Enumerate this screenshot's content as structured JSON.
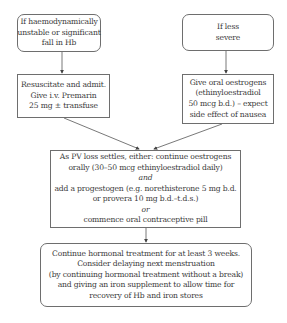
{
  "flowchart": {
    "nodes": {
      "unstable": {
        "shape": "rounded",
        "lines": [
          "If haemodynamically",
          "unstable or significant",
          "fall in Hb"
        ]
      },
      "less_severe": {
        "shape": "rounded",
        "lines": [
          "If less",
          "severe"
        ]
      },
      "resuscitate": {
        "shape": "rectangle",
        "lines": [
          "Resuscitate and admit.",
          "Give i.v. Premarin",
          "25 mg ± transfuse"
        ]
      },
      "oral_oestrogens": {
        "shape": "rectangle",
        "lines": [
          "Give oral oestrogens",
          "(ethinyloestradiol",
          "50 mcg b.d.) – expect",
          "side effect of nausea"
        ]
      },
      "pv_loss": {
        "shape": "rectangle",
        "lines": [
          "As PV loss settles, either: continue oestrogens",
          "orally (30–50 mcg ethinyloestradiol daily)",
          "and",
          "add a progestogen (e.g. norethisterone 5 mg b.d.",
          "or provera 10 mg b.d.–t.d.s.)",
          "or",
          "commence oral contraceptive pill"
        ],
        "italic_lines": [
          2,
          5
        ]
      },
      "continue": {
        "shape": "rounded",
        "lines": [
          "Continue hormonal treatment for at least 3 weeks.",
          "Consider delaying next menstruation",
          "(by continuing hormonal treatment without a break)",
          "and giving an iron supplement to allow time for",
          "recovery of Hb and iron stores"
        ]
      }
    },
    "edges": [
      {
        "from": "unstable",
        "to": "resuscitate"
      },
      {
        "from": "less_severe",
        "to": "oral_oestrogens"
      },
      {
        "from": "resuscitate",
        "to": "pv_loss"
      },
      {
        "from": "oral_oestrogens",
        "to": "pv_loss"
      },
      {
        "from": "pv_loss",
        "to": "continue"
      }
    ],
    "colors": {
      "border": "#6e6e6e",
      "text": "#3a3a3a",
      "arrow": "#444444",
      "background": "#ffffff"
    }
  }
}
